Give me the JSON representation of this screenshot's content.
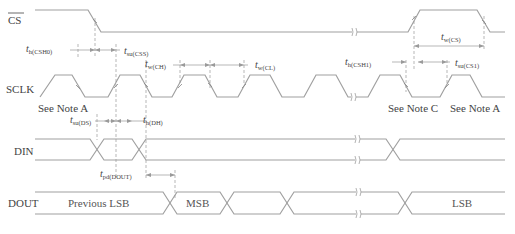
{
  "signals": {
    "cs": "CS",
    "sclk": "SCLK",
    "din": "DIN",
    "dout": "DOUT"
  },
  "notes": {
    "note_a_left": "See Note A",
    "note_c": "See Note C",
    "note_a_right": "See Note A"
  },
  "timing": {
    "th_csh0": {
      "t": "t",
      "sub": "h(CSH0)"
    },
    "tsu_css": {
      "t": "t",
      "sub": "su(CSS)"
    },
    "tw_ch": {
      "t": "t",
      "sub": "w(CH)"
    },
    "tw_cl": {
      "t": "t",
      "sub": "w(CL)"
    },
    "th_csh1": {
      "t": "t",
      "sub": "h(CSH1)"
    },
    "tw_cs": {
      "t": "t",
      "sub": "w(CS)"
    },
    "tsu_cs1": {
      "t": "t",
      "sub": "su(CS1)"
    },
    "tsu_ds": {
      "t": "t",
      "sub": "su(DS)"
    },
    "th_dh": {
      "t": "t",
      "sub": "h(DH)"
    },
    "tpd_dout": {
      "t": "t",
      "sub": "pd(DOUT)"
    }
  },
  "dout_data": {
    "previous_lsb": "Previous LSB",
    "msb": "MSB",
    "lsb": "LSB"
  },
  "colors": {
    "waveform": "#a0a0a0",
    "text": "#444444",
    "background": "#ffffff"
  }
}
